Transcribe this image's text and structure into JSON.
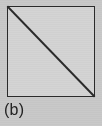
{
  "figure": {
    "label": "(b)",
    "caption_position": "below-left",
    "background_color": "#c9c9c9",
    "shape": {
      "name": "square-with-diagonal",
      "type": "square",
      "fill_color": "#d4d4d4",
      "stroke_color": "#2b2b2b",
      "stroke_width_px": 1.6,
      "x_px": 7,
      "y_px": 6,
      "width_px": 88,
      "height_px": 91
    },
    "diagonal": {
      "name": "diagonal-line",
      "from": "top-left",
      "to": "bottom-right",
      "x1_px": 0,
      "y1_px": 0,
      "x2_px": 88,
      "y2_px": 91,
      "stroke_color": "#2b2b2b",
      "stroke_width_px": 2
    }
  }
}
